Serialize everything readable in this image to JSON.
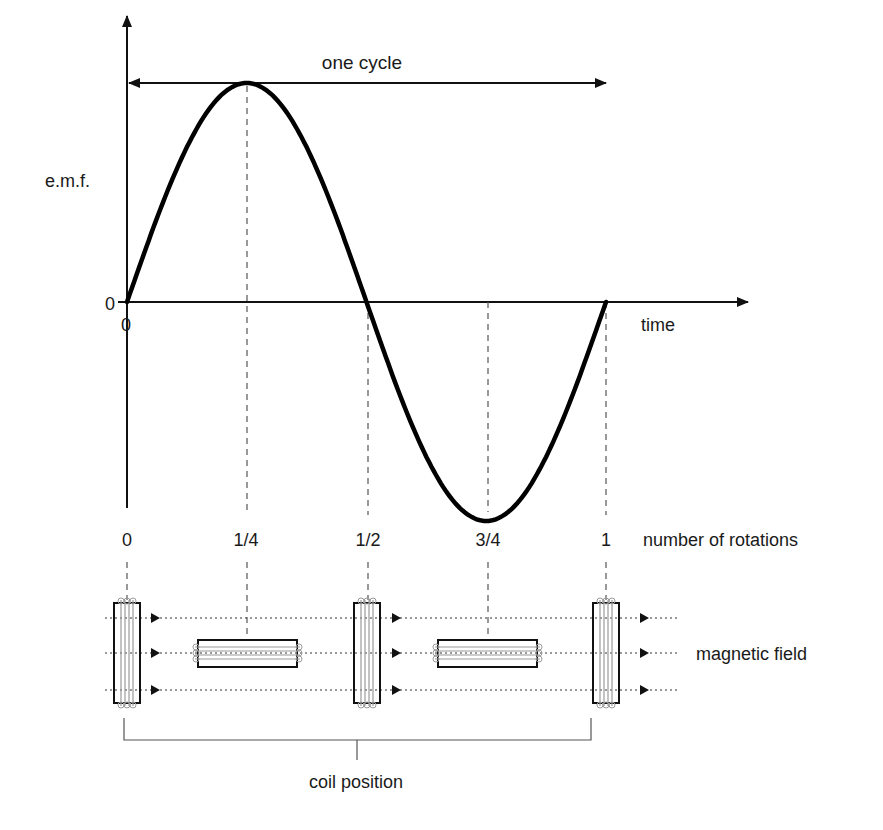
{
  "figure": {
    "title": "one cycle",
    "y_axis_label": "e.m.f.",
    "y_origin_label": "0",
    "x_origin_label": "0",
    "x_axis_label": "time",
    "rotation_axis_label": "number of rotations",
    "rotation_ticks": [
      "0",
      "1/4",
      "1/2",
      "3/4",
      "1"
    ],
    "field_label": "magnetic field",
    "coil_label": "coil position",
    "coil_orientations": [
      "vertical",
      "horizontal",
      "vertical",
      "horizontal",
      "vertical"
    ],
    "colors": {
      "curve": "#000000",
      "axis": "#111111",
      "dashed_guides": "#555555",
      "field_lines": "#333333",
      "coil_windings": "#9a9a9a",
      "background": "#ffffff"
    }
  },
  "chart_data": {
    "type": "line",
    "title": "one cycle",
    "xlabel": "time",
    "ylabel": "e.m.f.",
    "x": [
      0,
      0.125,
      0.25,
      0.375,
      0.5,
      0.625,
      0.75,
      0.875,
      1
    ],
    "series": [
      {
        "name": "e.m.f. (sinusoidal)",
        "values": [
          0,
          0.707,
          1,
          0.707,
          0,
          -0.707,
          -1,
          -0.707,
          0
        ]
      }
    ],
    "x_tick_labels": [
      "0",
      "1/4",
      "1/2",
      "3/4",
      "1"
    ],
    "secondary_xlabel": "number of rotations",
    "ylim": [
      -1,
      1
    ],
    "grid": false,
    "annotations": [
      "one cycle (double arrow spanning 0 to 1)",
      "dashed guides at 1/4, 1/2, 3/4, 1",
      "coil position diagrams below each tick",
      "magnetic field arrows left to right"
    ]
  }
}
